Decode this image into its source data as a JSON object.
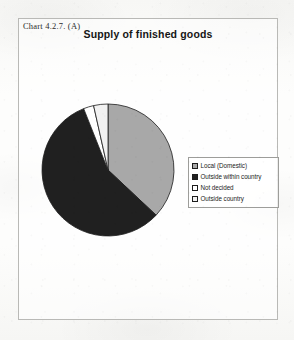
{
  "figure": {
    "label": "Chart 4.2.7. (A)",
    "title": "Supply of finished goods"
  },
  "colors": {
    "slice_local_domestic": "#a8a8a8",
    "slice_outside_within_country": "#202020",
    "slice_not_decided": "#ffffff",
    "slice_outside_country": "#f2f2f2",
    "slice_outline": "#1d1d1d",
    "frame_border": "#b9b9b6",
    "legend_border": "#9d9d9a",
    "text": "#1b1b1b",
    "paper": "#fbfbfa"
  },
  "legend": {
    "items": [
      {
        "label": "Local (Domestic)",
        "swatch": "#a8a8a8"
      },
      {
        "label": "Outside within country",
        "swatch": "#202020"
      },
      {
        "label": "Not decided",
        "swatch": "#ffffff"
      },
      {
        "label": "Outside country",
        "swatch": "#f2f2f2"
      }
    ]
  },
  "chart_data": {
    "type": "pie",
    "title": "Supply of finished goods",
    "categories": [
      "Local (Domestic)",
      "Outside within country",
      "Not decided",
      "Outside country"
    ],
    "values": [
      37,
      57,
      2.5,
      3.5
    ],
    "unit": "percent",
    "start_angle_deg": 0,
    "direction": "clockwise",
    "colors": [
      "#a8a8a8",
      "#202020",
      "#ffffff",
      "#f2f2f2"
    ],
    "legend_position": "right",
    "data_labels_shown": false,
    "grid": false,
    "center": {
      "cx": 67,
      "cy": 67
    },
    "radius": 66
  }
}
